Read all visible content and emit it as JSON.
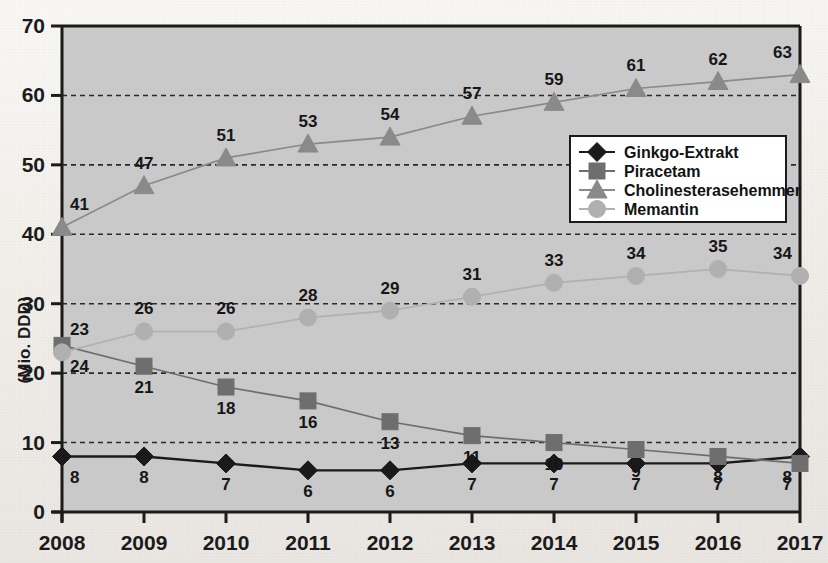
{
  "chart_data": {
    "type": "line",
    "title": "",
    "xlabel": "",
    "ylabel": "(Mio. DDD)",
    "categories": [
      "2008",
      "2009",
      "2010",
      "2011",
      "2012",
      "2013",
      "2014",
      "2015",
      "2016",
      "2017"
    ],
    "ylim": [
      0,
      70
    ],
    "yticks": [
      0,
      10,
      20,
      30,
      40,
      50,
      60,
      70
    ],
    "grid": "horizontal-dashed",
    "legend_position": "center-right",
    "series": [
      {
        "name": "Ginkgo-Extrakt",
        "marker": "diamond",
        "color": "#1a1a1a",
        "values": [
          8,
          8,
          7,
          6,
          6,
          7,
          7,
          7,
          7,
          8
        ],
        "label_side": "below"
      },
      {
        "name": "Piracetam",
        "marker": "square",
        "color": "#6e6e6e",
        "values": [
          24,
          21,
          18,
          16,
          13,
          11,
          10,
          9,
          8,
          7
        ],
        "label_side": "below"
      },
      {
        "name": "Cholinesterasehemmer",
        "marker": "triangle",
        "color": "#8a8a8a",
        "values": [
          41,
          47,
          51,
          53,
          54,
          57,
          59,
          61,
          62,
          63
        ],
        "label_side": "above"
      },
      {
        "name": "Memantin",
        "marker": "circle",
        "color": "#b0b0b0",
        "values": [
          23,
          26,
          26,
          28,
          29,
          31,
          33,
          34,
          35,
          34
        ],
        "label_side": "above"
      }
    ]
  },
  "axes": {
    "y_tick_labels": [
      "70",
      "60",
      "50",
      "40",
      "30",
      "20",
      "10",
      "0"
    ],
    "x_tick_labels": [
      "2008",
      "2009",
      "2010",
      "2011",
      "2012",
      "2013",
      "2014",
      "2015",
      "2016",
      "2017"
    ],
    "y_axis_title": "(Mio. DDD)"
  },
  "legend": {
    "items": [
      {
        "label": "Ginkgo-Extrakt",
        "marker": "diamond",
        "color": "#1a1a1a"
      },
      {
        "label": "Piracetam",
        "marker": "square",
        "color": "#6e6e6e"
      },
      {
        "label": "Cholinesterasehemmer",
        "marker": "triangle",
        "color": "#8a8a8a"
      },
      {
        "label": "Memantin",
        "marker": "circle",
        "color": "#b0b0b0"
      }
    ]
  },
  "colors": {
    "plot_background": "#c9c9c9",
    "page_background": "#f1eeea",
    "axis": "#1b1b1b",
    "gridline": "#2a2a2a"
  }
}
